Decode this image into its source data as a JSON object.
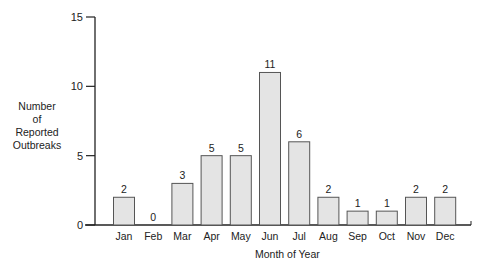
{
  "chart_data": {
    "type": "bar",
    "title": "",
    "xlabel": "Month of Year",
    "ylabel": "Number of Reported Outbreaks",
    "categories": [
      "Jan",
      "Feb",
      "Mar",
      "Apr",
      "May",
      "Jun",
      "Jul",
      "Aug",
      "Sep",
      "Oct",
      "Nov",
      "Dec"
    ],
    "values": [
      2,
      0,
      3,
      5,
      5,
      11,
      6,
      2,
      1,
      1,
      2,
      2
    ],
    "data_labels": [
      "2",
      "0",
      "3",
      "5",
      "5",
      "11",
      "6",
      "2",
      "1",
      "1",
      "2",
      "2"
    ],
    "ylim": [
      0,
      15
    ],
    "yticks": [
      0,
      5,
      10,
      15
    ],
    "grid": false,
    "legend": null,
    "bar_color": "#e4e4e4",
    "bar_edge_color": "#555555"
  },
  "axis": {
    "ylabel_lines": [
      "Number",
      "of",
      "Reported",
      "Outbreaks"
    ],
    "xlabel": "Month of Year"
  }
}
